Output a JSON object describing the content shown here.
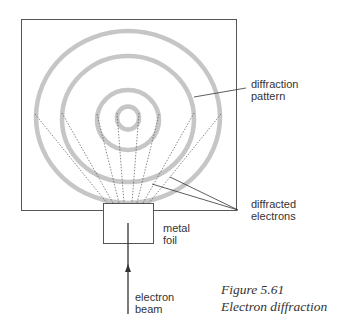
{
  "figure": {
    "caption_number": "Figure 5.61",
    "caption_title": "Electron diffraction"
  },
  "labels": {
    "pattern_line1": "diffraction",
    "pattern_line2": "pattern",
    "electrons_line1": "diffracted",
    "electrons_line2": "electrons",
    "foil_line1": "metal",
    "foil_line2": "foil",
    "beam_line1": "electron",
    "beam_line2": "beam"
  },
  "colors": {
    "ring": "#c4c4c4",
    "line": "#444444",
    "text": "#333333"
  },
  "diagram": {
    "rings": [
      {
        "name": "ring-1-inner",
        "cx": 128,
        "cy": 118,
        "rx": 11,
        "ry": 12
      },
      {
        "name": "ring-2",
        "cx": 128,
        "cy": 120,
        "rx": 31,
        "ry": 30
      },
      {
        "name": "ring-3",
        "cx": 128,
        "cy": 119,
        "rx": 66,
        "ry": 63
      },
      {
        "name": "ring-4-outer",
        "cx": 128,
        "cy": 117,
        "rx": 92,
        "ry": 86
      }
    ]
  }
}
